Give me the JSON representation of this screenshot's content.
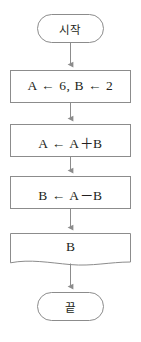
{
  "diagram": {
    "background_color": "#ffffff",
    "stroke_color": "#8c8c8c",
    "text_color": "#231f20",
    "connector_color": "#8c8c8c",
    "nodes": [
      {
        "id": "start",
        "shape": "terminal",
        "label": "시작",
        "name": "start-terminal"
      },
      {
        "id": "init",
        "shape": "process",
        "label": "A ← 6, B ← 2",
        "name": "process-init"
      },
      {
        "id": "sum",
        "shape": "process",
        "label": "A ← A＋B",
        "name": "process-a-assign"
      },
      {
        "id": "diff",
        "shape": "process",
        "label": "B ← A－B",
        "name": "process-b-assign"
      },
      {
        "id": "output",
        "shape": "document",
        "label": "B",
        "name": "output-document"
      },
      {
        "id": "end",
        "shape": "terminal",
        "label": "끝",
        "name": "end-terminal"
      }
    ],
    "connectors": [
      {
        "from": "start",
        "to": "init",
        "name": "connector-start-to-init"
      },
      {
        "from": "init",
        "to": "sum",
        "name": "connector-init-to-sum"
      },
      {
        "from": "sum",
        "to": "diff",
        "name": "connector-sum-to-diff"
      },
      {
        "from": "diff",
        "to": "output",
        "name": "connector-diff-to-output"
      },
      {
        "from": "output",
        "to": "end",
        "name": "connector-output-to-end"
      }
    ]
  }
}
